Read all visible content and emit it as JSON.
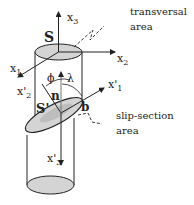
{
  "figure": {
    "labels": {
      "x3": "x",
      "x3_sub": "3",
      "x2": "x",
      "x2_sub": "2",
      "x1": "x",
      "x1_sub": "1",
      "x1p": "x'",
      "x1p_sub": "1",
      "x2p": "x'",
      "x2p_sub": "2",
      "x3p": "x'",
      "x3p_sub": "3",
      "S": "S",
      "Sp": "S'",
      "n": "n",
      "b": "b",
      "phi": "ϕ",
      "lambda": "λ"
    },
    "annotations": {
      "transversal_line1": "transversal",
      "transversal_line2": "area",
      "slip_line1": "slip-section",
      "slip_line2": "area"
    },
    "colors": {
      "stroke": "#222222",
      "fill_area": "#d4d4d4",
      "background": "#ffffff"
    }
  }
}
